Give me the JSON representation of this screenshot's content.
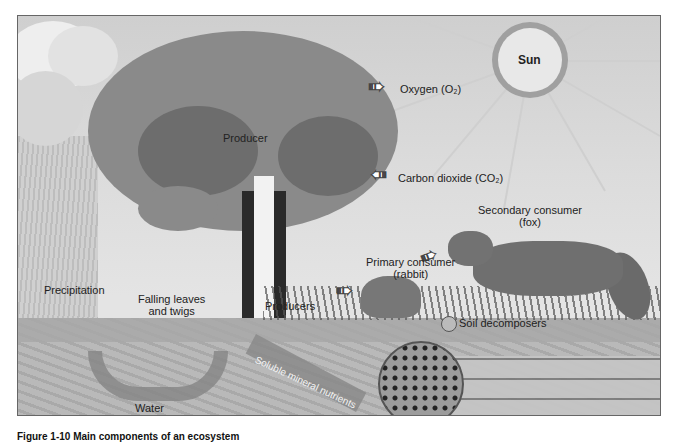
{
  "figure": {
    "labels": {
      "sun": "Sun",
      "oxygen": "Oxygen (O₂)",
      "carbon_dioxide": "Carbon dioxide (CO₂)",
      "producer": "Producer",
      "producers": "Producers",
      "precipitation": "Precipitation",
      "falling_leaves_1": "Falling leaves",
      "falling_leaves_2": "and twigs",
      "primary_consumer_1": "Primary consumer",
      "primary_consumer_2": "(rabbit)",
      "secondary_consumer_1": "Secondary consumer",
      "secondary_consumer_2": "(fox)",
      "soil_decomposers": "Soil decomposers",
      "water": "Water",
      "soluble_minerals": "Soluble mineral nutrients"
    },
    "caption": "Figure 1-10 Main components of an ecosystem"
  }
}
